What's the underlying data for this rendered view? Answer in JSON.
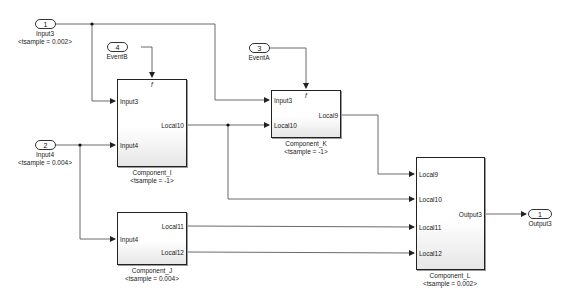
{
  "diagram": {
    "inports": [
      {
        "id": "input3",
        "number": "1",
        "name": "Input3",
        "sample": "<tsample = 0.002>"
      },
      {
        "id": "input4",
        "number": "2",
        "name": "Input4",
        "sample": "<tsample = 0.004>"
      },
      {
        "id": "eventA",
        "number": "3",
        "name": "EventA",
        "sample": ""
      },
      {
        "id": "eventB",
        "number": "4",
        "name": "EventB",
        "sample": ""
      }
    ],
    "outports": [
      {
        "id": "output3",
        "number": "1",
        "name": "Output3"
      }
    ],
    "blocks": [
      {
        "id": "component_i",
        "name": "Component_I",
        "sample": "<tsample = -1>",
        "trigger": "f",
        "inputs": [
          "Input3",
          "Input4"
        ],
        "outputs": [
          "Local10"
        ]
      },
      {
        "id": "component_k",
        "name": "Component_K",
        "sample": "<tsample = -1>",
        "trigger": "f",
        "inputs": [
          "Input3",
          "Local10"
        ],
        "outputs": [
          "Local9"
        ]
      },
      {
        "id": "component_j",
        "name": "Component_J",
        "sample": "<tsample = 0.004>",
        "inputs": [
          "Input4"
        ],
        "outputs": [
          "Local11",
          "Local12"
        ]
      },
      {
        "id": "component_l",
        "name": "Component_L",
        "sample": "<tsample = 0.002>",
        "inputs": [
          "Local9",
          "Local10",
          "Local11",
          "Local12"
        ],
        "outputs": [
          "Output3"
        ]
      }
    ],
    "colors": {
      "line": "#333333",
      "block_border": "#222222",
      "background": "#ffffff"
    }
  }
}
